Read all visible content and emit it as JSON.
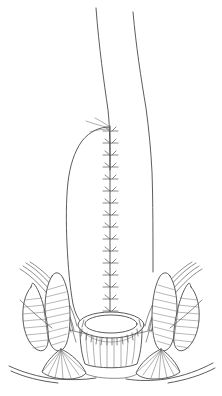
{
  "figure": {
    "domain_kind": "medical-line-illustration",
    "canvas": {
      "width": 222,
      "height": 396
    },
    "background_color": "#ffffff",
    "line_color": "#4a4a4a",
    "hatch_color": "#707070",
    "suture_color": "#555555"
  },
  "structures": {
    "bowel_limb": {
      "name": "descending bowel limb",
      "left_wall_top_x": 96,
      "right_wall_top_x": 133,
      "top_y": 8
    },
    "neorectum_pouch": {
      "name": "neorectal pouch wall",
      "apex_y": 126
    },
    "suture_line": {
      "name": "vertical staple suture line",
      "x": 110,
      "start_y": 126,
      "end_y": 318,
      "stitch_count": 17,
      "stitch_spacing": 12,
      "stitch_half_width": 6
    },
    "anastomotic_ring": {
      "name": "anastomotic ring",
      "center_x": 111,
      "center_y": 325,
      "outer_rx": 33,
      "outer_ry": 13,
      "inner_rx": 26,
      "inner_ry": 9,
      "radial_suture_count": 19
    },
    "anal_canal": {
      "name": "anal canal mucosal columns",
      "fold_count": 9,
      "top_y": 334,
      "bottom_y": 366
    },
    "internal_sphincter_left": {
      "name": "internal sphincter, left",
      "cx": 57,
      "cy": 318
    },
    "internal_sphincter_right": {
      "name": "internal sphincter, right",
      "cx": 165,
      "cy": 318
    },
    "external_sphincter_left": {
      "name": "external sphincter, left",
      "cx": 38,
      "cy": 320
    },
    "external_sphincter_right": {
      "name": "external sphincter, right",
      "cx": 184,
      "cy": 320
    },
    "levator_fibers_left": {
      "name": "levator ani fibers, left",
      "count": 4
    },
    "levator_fibers_right": {
      "name": "levator ani fibers, right",
      "count": 4
    },
    "fan_muscle_left": {
      "name": "fan-shaped muscle insertion, left",
      "apex_x": 61,
      "apex_y": 349
    },
    "fan_muscle_right": {
      "name": "fan-shaped muscle insertion, right",
      "apex_x": 161,
      "apex_y": 349
    },
    "perineal_skin_left": {
      "name": "perineal skin contour, left"
    },
    "perineal_skin_right": {
      "name": "perineal skin contour, right"
    }
  }
}
